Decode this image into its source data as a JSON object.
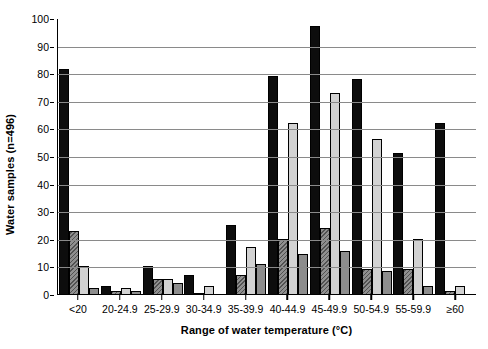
{
  "chart_data": {
    "type": "bar",
    "title": "",
    "subtitle": "",
    "xlabel": "Range of water temperature (°C)",
    "ylabel": "Water samples (n=496)",
    "ylim": [
      0,
      100
    ],
    "ytick_step": 10,
    "yticks": [
      0,
      10,
      20,
      30,
      40,
      50,
      60,
      70,
      80,
      90,
      100
    ],
    "grid": true,
    "grid_axis": "y",
    "legend": false,
    "legend_position": "none",
    "categories": [
      "<20",
      "20-24.9",
      "25-29.9",
      "30-34.9",
      "35-39.9",
      "40-44.9",
      "45-49.9",
      "50-54.9",
      "55-59.9",
      "≥60"
    ],
    "series": [
      {
        "name": "series-1",
        "style": "solid-black",
        "color": "#0d0d0d",
        "values": [
          81.5,
          3,
          10,
          7,
          25,
          79,
          97,
          78,
          51,
          62
        ]
      },
      {
        "name": "series-2",
        "style": "hatched-gray",
        "color": "#8f8f8f",
        "values": [
          23,
          1,
          5.5,
          0.5,
          7,
          20,
          24,
          9,
          9,
          1
        ]
      },
      {
        "name": "series-3",
        "style": "light-gray",
        "color": "#d2d2d2",
        "values": [
          10,
          2,
          5.5,
          3,
          17,
          62,
          73,
          56,
          20,
          3
        ]
      },
      {
        "name": "series-4",
        "style": "medium-gray",
        "color": "#8d8d8d",
        "values": [
          2,
          1,
          4,
          0,
          11,
          14.5,
          15.5,
          8.5,
          3,
          0
        ]
      }
    ]
  }
}
